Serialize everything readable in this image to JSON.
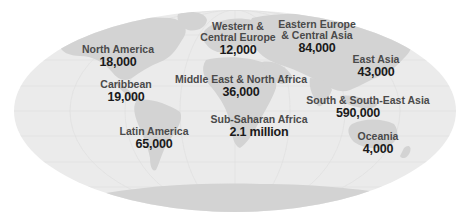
{
  "map": {
    "projection": "world-ellipse",
    "colors": {
      "ocean": "#ebebeb",
      "land": "#d3d3d3",
      "land_dark": "#c8c8c8",
      "label_name": "#4a4a4a",
      "label_value": "#1a1a1a"
    },
    "regions": [
      {
        "name": "North America",
        "value": "18,000",
        "x": 118,
        "y": 44
      },
      {
        "name": "Caribbean",
        "value": "19,000",
        "x": 126,
        "y": 79
      },
      {
        "name": "Latin America",
        "value": "65,000",
        "x": 154,
        "y": 126
      },
      {
        "name": "Western & Central Europe",
        "name_line1": "Western &",
        "name_line2": "Central Europe",
        "value": "12,000",
        "x": 238,
        "y": 21
      },
      {
        "name": "Eastern Europe & Central Asia",
        "name_line1": "Eastern Europe",
        "name_line2": "& Central Asia",
        "value": "84,000",
        "x": 317,
        "y": 19
      },
      {
        "name": "Middle East & North Africa",
        "value": "36,000",
        "x": 241,
        "y": 74
      },
      {
        "name": "East Asia",
        "value": "43,000",
        "x": 376,
        "y": 54
      },
      {
        "name": "South & South-East Asia",
        "value": "590,000",
        "x": 368,
        "y": 95
      },
      {
        "name": "Sub-Saharan Africa",
        "value": "2.1 million",
        "x": 259,
        "y": 114
      },
      {
        "name": "Oceania",
        "value": "4,000",
        "x": 378,
        "y": 131
      }
    ]
  }
}
